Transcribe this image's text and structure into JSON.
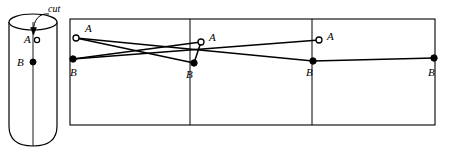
{
  "figure": {
    "background_color": "#ffffff",
    "stroke_color": "#000000",
    "width": 449,
    "height": 149
  },
  "cylinder": {
    "name": "cylinder",
    "labels": {
      "cut": "cut",
      "point_a": "A",
      "point_b": "B"
    },
    "point_a_style": "hollow",
    "point_b_style": "filled",
    "geometry": {
      "cx": 33,
      "top_cy": 22,
      "rx": 24,
      "ry": 8,
      "bottom_cy": 138,
      "body_left": 9,
      "body_right": 57
    }
  },
  "unrolled": {
    "name": "unrolled-rectangle",
    "rect": {
      "x": 70,
      "y": 19,
      "width": 365,
      "height": 106
    },
    "dividers": [
      190,
      312
    ],
    "points": [
      {
        "id": "a1",
        "label": "A",
        "style": "hollow",
        "x": 76,
        "y": 38,
        "label_x": 85,
        "label_y": 32
      },
      {
        "id": "b1",
        "label": "B",
        "style": "filled",
        "x": 73,
        "y": 59,
        "label_x": 73,
        "label_y": 76
      },
      {
        "id": "a2",
        "label": "A",
        "style": "hollow",
        "x": 201,
        "y": 42,
        "label_x": 210,
        "label_y": 40
      },
      {
        "id": "b2",
        "label": "B",
        "style": "filled",
        "x": 194,
        "y": 63,
        "label_x": 188,
        "label_y": 78
      },
      {
        "id": "a3",
        "label": "A",
        "style": "hollow",
        "x": 319,
        "y": 40,
        "label_x": 328,
        "label_y": 40
      },
      {
        "id": "b3",
        "label": "B",
        "style": "filled",
        "x": 313,
        "y": 61,
        "label_x": 308,
        "label_y": 76
      },
      {
        "id": "b4",
        "label": "B",
        "style": "filled",
        "x": 434,
        "y": 58,
        "label_x": 430,
        "label_y": 76
      }
    ],
    "paths": [
      {
        "id": "path-a1-b2",
        "from": "a1",
        "to": "b2",
        "x1": 76,
        "y1": 38,
        "x2": 194,
        "y2": 63
      },
      {
        "id": "path-a1-b3",
        "from": "a1",
        "to": "b3",
        "x1": 76,
        "y1": 38,
        "x2": 313,
        "y2": 61
      },
      {
        "id": "path-b1-a2",
        "from": "b1",
        "to": "a2",
        "x1": 73,
        "y1": 59,
        "x2": 201,
        "y2": 42
      },
      {
        "id": "path-b1-a3",
        "from": "b1",
        "to": "a3",
        "x1": 73,
        "y1": 59,
        "x2": 319,
        "y2": 40
      },
      {
        "id": "path-a2-b2",
        "from": "a2",
        "to": "b2",
        "x1": 201,
        "y1": 42,
        "x2": 194,
        "y2": 63
      },
      {
        "id": "path-b3-b4",
        "from": "b3",
        "to": "b4",
        "x1": 313,
        "y1": 61,
        "x2": 434,
        "y2": 58
      }
    ]
  }
}
